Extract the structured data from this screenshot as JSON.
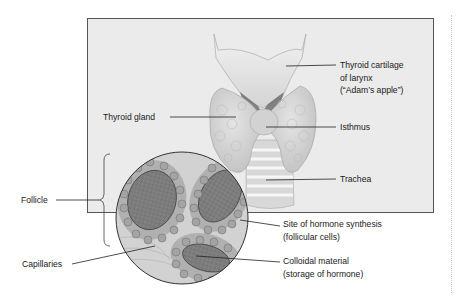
{
  "figure": {
    "labels": {
      "thyroid_cartilage": [
        "Thyroid cartilage",
        "of larynx",
        "(“Adam’s apple”)"
      ],
      "thyroid_gland": "Thyroid gland",
      "isthmus": "Isthmus",
      "trachea": "Trachea",
      "follicle": "Follicle",
      "site_of_synthesis": [
        "Site of hormone synthesis",
        "(follicular cells)"
      ],
      "capillaries": "Capillaries",
      "colloidal_material": [
        "Colloidal material",
        "(storage of hormone)"
      ]
    },
    "colors": {
      "panel_background": "#ebebeb",
      "panel_border": "#555555",
      "tissue_light": "#dcdcdc",
      "tissue_mid": "#bdbdbd",
      "colloid": "#7a7a7a",
      "cell": "#a8a8a8",
      "leader_line": "#222222"
    }
  }
}
